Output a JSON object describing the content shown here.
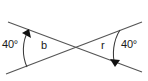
{
  "figure": {
    "kind": "geometry-diagram",
    "background_color": "#ffffff",
    "line_color": "#555555",
    "arc_color": "#3a3a3a",
    "text_color": "#1a1a1a",
    "width": 148,
    "height": 81
  },
  "labels": {
    "angle_left": "40°",
    "angle_right": "40°",
    "var_left": "b",
    "var_right": "r"
  },
  "geometry": {
    "intersection": {
      "x": 74,
      "y": 47
    },
    "lines": [
      {
        "name": "line-upper-left-to-lower-right",
        "x1": 8,
        "y1": 22,
        "x2": 142,
        "y2": 72
      },
      {
        "name": "line-lower-left-to-upper-right",
        "x1": 6,
        "y1": 74,
        "x2": 142,
        "y2": 22
      }
    ],
    "arcs": [
      {
        "name": "arc-left",
        "path": "M 28 31 C 22 42, 22 56, 27 67",
        "arrow_at": "start",
        "arrow_points": "28,30 23,33 30,37"
      },
      {
        "name": "arc-right",
        "path": "M 120 30 C 114 41, 113 55, 115 65",
        "arrow_at": "end",
        "arrow_points": "115,66 111,60 119,61"
      }
    ]
  }
}
